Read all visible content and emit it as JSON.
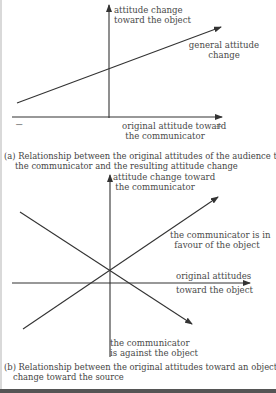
{
  "diagram_a": {
    "y_axis_label_line1": "attitude change",
    "y_axis_label_line2": "toward the object",
    "line_label_line1": "general attitude",
    "line_label_line2": "change",
    "x_axis_label_line1": "original attitude toward",
    "x_axis_label_line2": "the communicator",
    "minus_sign": "−",
    "plus_sign": "+",
    "caption_line1": "(a) Relationship between the original attitudes of the audience toward",
    "caption_line2": "the communicator and the resulting attitude change"
  },
  "diagram_b": {
    "y_axis_label_line1": "attitude change toward",
    "y_axis_label_line2": "the communicator",
    "rising_line_label_line1": "the communicator is in",
    "rising_line_label_line2": "favour of the object",
    "x_axis_label_line1": "original attitudes",
    "x_axis_label_line2": "toward the object",
    "falling_line_label_line1": "the communicator",
    "falling_line_label_line2": "is against the object",
    "caption_line1": "(b) Relationship between the original attitudes toward an object and attitude",
    "caption_line2": "change toward the source"
  },
  "colors": {
    "line": "#3a3a3a",
    "text": "#4a4a4a",
    "border": "#555555"
  }
}
